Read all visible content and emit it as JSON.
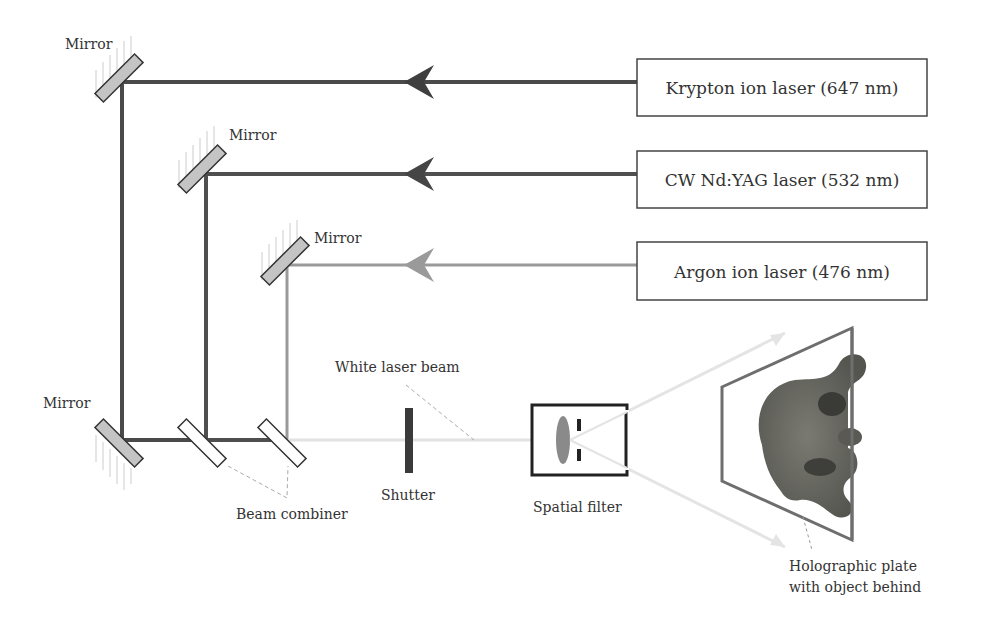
{
  "diagram": {
    "lasers": [
      {
        "label": "Krypton ion laser (647 nm)",
        "color": "#4a4a4a"
      },
      {
        "label": "CW Nd:YAG laser (532 nm)",
        "color": "#4f4f4f"
      },
      {
        "label": "Argon ion laser (476 nm)",
        "color": "#9a9a9a"
      }
    ],
    "labels": {
      "mirror_1": "Mirror",
      "mirror_2": "Mirror",
      "mirror_3": "Mirror",
      "mirror_4": "Mirror",
      "white_beam": "White laser beam",
      "shutter": "Shutter",
      "beam_combiner": "Beam combiner",
      "spatial_filter": "Spatial filter",
      "plate_line1": "Holographic plate",
      "plate_line2": "with object behind"
    },
    "colors": {
      "mirror_fill": "#c4c4c4",
      "outline": "#333333",
      "white_beam": "#e2e2e2",
      "plate_frame": "#6e6e6e",
      "leader": "#aaaaaa"
    }
  }
}
